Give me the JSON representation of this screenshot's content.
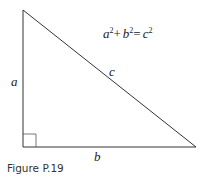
{
  "diagram": {
    "type": "right-triangle",
    "labels": {
      "a": "a",
      "b": "b",
      "c": "c"
    },
    "equation": {
      "a": "a",
      "b": "b",
      "c": "c",
      "exp": "2",
      "plus": "+",
      "equals": "="
    },
    "caption": "Figure P.19"
  }
}
